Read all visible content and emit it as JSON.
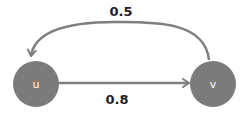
{
  "diagram": {
    "type": "directed-graph",
    "colors": {
      "node_fill": "#7b7b7b",
      "edge_stroke": "#7f7f7f",
      "node_text": "#ffffff",
      "edge_label_text": "#222222"
    },
    "nodes": [
      {
        "id": "u",
        "label": "u"
      },
      {
        "id": "v",
        "label": "v"
      }
    ],
    "edges": [
      {
        "from": "u",
        "to": "v",
        "weight": "0.8",
        "shape": "straight"
      },
      {
        "from": "v",
        "to": "u",
        "weight": "0.5",
        "shape": "arc-over-top"
      }
    ]
  }
}
